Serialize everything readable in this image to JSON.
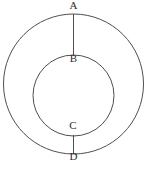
{
  "figure": {
    "kind": "geometry-diagram",
    "background_color": "#ffffff",
    "stroke_color": "#4f4f4f",
    "label_color": "#2b2b2b",
    "canvas": {
      "width": 149,
      "height": 170
    },
    "shapes": {
      "outer_circle": {
        "cx": 73.5,
        "cy": 84,
        "r": 70
      },
      "inner_circle": {
        "cx": 73.5,
        "cy": 95.5,
        "r": 40.5
      },
      "segment_top": {
        "x1": 73.5,
        "y1": 14,
        "x2": 73.5,
        "y2": 56
      },
      "segment_bottom": {
        "x1": 73.5,
        "y1": 135,
        "x2": 73.5,
        "y2": 154
      }
    },
    "labels": [
      {
        "id": "A",
        "text": "A",
        "x": 73.5,
        "y": 9,
        "anchor": "outer-circle-top"
      },
      {
        "id": "B",
        "text": "B",
        "x": 73.5,
        "y": 62,
        "anchor": "inner-circle-top"
      },
      {
        "id": "C",
        "text": "C",
        "x": 73.0,
        "y": 129,
        "anchor": "inner-circle-bottom"
      },
      {
        "id": "D",
        "text": "D",
        "x": 73.5,
        "y": 160,
        "anchor": "outer-circle-bottom"
      }
    ]
  }
}
